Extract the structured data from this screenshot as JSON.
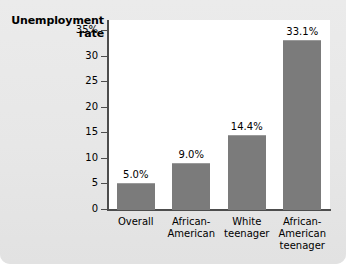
{
  "chart_data": {
    "type": "bar",
    "title": "Unemployment rate",
    "title_line1": "Unemployment",
    "title_line2": "rate",
    "xlabel": "",
    "ylabel": "Unemployment rate",
    "ylim": [
      0,
      37
    ],
    "grid": false,
    "legend": null,
    "categories": [
      "Overall",
      "African-American",
      "White teenager",
      "African-American teenager"
    ],
    "category_lines": [
      [
        "Overall"
      ],
      [
        "African-",
        "American"
      ],
      [
        "White",
        "teenager"
      ],
      [
        "African-",
        "American",
        "teenager"
      ]
    ],
    "values": [
      5.0,
      9.0,
      14.4,
      33.1
    ],
    "value_labels": [
      "5.0%",
      "9.0%",
      "14.4%",
      "33.1%"
    ],
    "yticks": [
      0,
      5,
      10,
      15,
      20,
      25,
      30,
      35
    ],
    "ytick_labels": [
      "0",
      "5",
      "10",
      "15",
      "20",
      "25",
      "30",
      "35%"
    ],
    "bar_color": "#7b7b7b",
    "plot_background": "#ffffff",
    "panel_background": "#e9e9e9",
    "axis_color": "#4d4d4d"
  }
}
